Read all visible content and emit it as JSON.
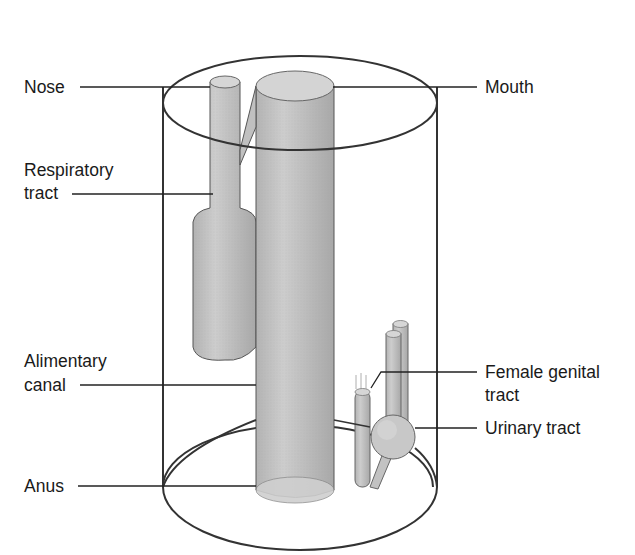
{
  "diagram": {
    "labels": {
      "nose": "Nose",
      "mouth": "Mouth",
      "respiratory_l1": "Respiratory",
      "respiratory_l2": "tract",
      "alimentary_l1": "Alimentary",
      "alimentary_l2": "canal",
      "female_l1": "Female genital",
      "female_l2": "tract",
      "urinary": "Urinary tract",
      "anus": "Anus"
    },
    "colors": {
      "outline": "#333333",
      "tube_fill": "#c4c4c4",
      "tube_dark": "#a9a9a9",
      "tube_top": "#d8d8d8",
      "text": "#1a1a1a",
      "background": "#ffffff"
    }
  }
}
